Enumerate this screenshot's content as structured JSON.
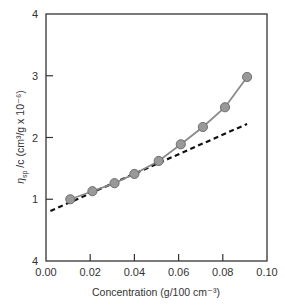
{
  "chart_data": {
    "type": "line",
    "title": "",
    "xlabel": "Concentration (g/100 cm⁻³)",
    "ylabel": "ηsp / c (cm³/g x 10⁻⁶)",
    "ylabel_parts": {
      "eta": "η",
      "sub": "sp",
      "rest": "/c (cm³/g x 10⁻⁶)"
    },
    "xlim": [
      0.0,
      0.1
    ],
    "ylim": [
      0,
      4
    ],
    "x_ticks": [
      "0.00",
      "0.02",
      "0.04",
      "0.06",
      "0.08",
      "0.10"
    ],
    "x_tick_values": [
      0.0,
      0.02,
      0.04,
      0.06,
      0.08,
      0.1
    ],
    "y_ticks": [
      "4",
      "1",
      "2",
      "3",
      "4"
    ],
    "y_tick_values": [
      0,
      1,
      2,
      3,
      4
    ],
    "grid": false,
    "series": [
      {
        "name": "measured",
        "style": "solid line with circle markers",
        "color": "#8a8a8a",
        "marker_color": "#999999",
        "x": [
          0.011,
          0.021,
          0.031,
          0.04,
          0.051,
          0.061,
          0.071,
          0.081,
          0.091
        ],
        "values": [
          1.0,
          1.13,
          1.26,
          1.41,
          1.62,
          1.89,
          2.17,
          2.49,
          2.98
        ]
      },
      {
        "name": "linear fit",
        "style": "dashed",
        "color": "#111111",
        "x": [
          0.002,
          0.091
        ],
        "values": [
          0.81,
          2.22
        ]
      }
    ]
  }
}
